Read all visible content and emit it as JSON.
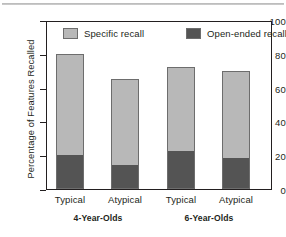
{
  "chart_data": {
    "type": "bar",
    "stacked": true,
    "title": "",
    "xlabel": "",
    "ylabel": "Percentage of Features Recalled",
    "ylim": [
      0,
      100
    ],
    "yticks": [
      0,
      20,
      40,
      60,
      80,
      100
    ],
    "ytick_labels": [
      "0",
      "20",
      "40",
      "60",
      "80",
      "100"
    ],
    "grid": false,
    "legend_position": "top-inside",
    "categories": [
      "Typical",
      "Atypical",
      "Typical",
      "Atypical"
    ],
    "groups": [
      {
        "label": "4-Year-Olds",
        "categories": [
          "Typical",
          "Atypical"
        ]
      },
      {
        "label": "6-Year-Olds",
        "categories": [
          "Typical",
          "Atypical"
        ]
      }
    ],
    "series": [
      {
        "name": "Open-ended recall",
        "color": "#545454",
        "values": [
          20,
          14,
          22,
          18
        ]
      },
      {
        "name": "Specific recall",
        "color": "#b8b8b8",
        "values": [
          60,
          51,
          50,
          52
        ]
      }
    ],
    "totals": [
      80,
      65,
      72,
      70
    ],
    "bars": [
      {
        "category": "Typical",
        "group": "4-Year-Olds",
        "open_ended": 20,
        "total": 80
      },
      {
        "category": "Atypical",
        "group": "4-Year-Olds",
        "open_ended": 14,
        "total": 65
      },
      {
        "category": "Typical",
        "group": "6-Year-Olds",
        "open_ended": 22,
        "total": 72
      },
      {
        "category": "Atypical",
        "group": "6-Year-Olds",
        "open_ended": 18,
        "total": 70
      }
    ]
  },
  "axis": {
    "y_title": "Percentage of Features Recalled",
    "y_labels": {
      "t100": "100",
      "t80": "80",
      "t60": "60",
      "t40": "40",
      "t20": "20",
      "t0": "0"
    }
  },
  "legend": {
    "items": [
      {
        "label": "Specific recall",
        "color": "#b8b8b8"
      },
      {
        "label": "Open-ended recall",
        "color": "#545454"
      }
    ]
  },
  "x_axis": {
    "ticks": [
      {
        "label": "Typical"
      },
      {
        "label": "Atypical"
      },
      {
        "label": "Typical"
      },
      {
        "label": "Atypical"
      }
    ],
    "groups": [
      {
        "label": "4-Year-Olds"
      },
      {
        "label": "6-Year-Olds"
      }
    ]
  },
  "colors": {
    "specific": "#b8b8b8",
    "open_ended": "#545454",
    "axis": "#231f20"
  }
}
